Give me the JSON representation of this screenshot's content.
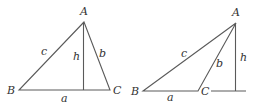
{
  "diagrams": [
    {
      "name": "acute-triangle",
      "vertices": {
        "A": "A",
        "B": "B",
        "C": "C"
      },
      "sides": {
        "a": "a",
        "b": "b",
        "c": "c"
      },
      "altitude": "h"
    },
    {
      "name": "obtuse-triangle",
      "vertices": {
        "A": "A",
        "B": "B",
        "C": "C"
      },
      "sides": {
        "a": "a",
        "b": "b",
        "c": "c"
      },
      "altitude": "h"
    }
  ],
  "colors": {
    "line": "#5a5a5a",
    "text": "#333333"
  }
}
